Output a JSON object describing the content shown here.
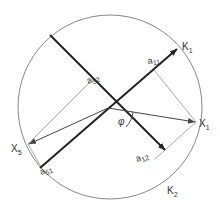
{
  "diagram": {
    "title": "",
    "circle": {
      "cx": 110,
      "cy": 107,
      "r": 92,
      "stroke": "#777777"
    },
    "origin": {
      "x": 108,
      "y": 108
    },
    "axes": [
      {
        "name": "K1",
        "from": [
          40,
          168
        ],
        "to": [
          177,
          49
        ],
        "label": "K",
        "sub": "1",
        "lx": 182,
        "ly": 50
      },
      {
        "name": "K2",
        "from": [
          50,
          35
        ],
        "to": [
          165,
          150
        ],
        "label": "K",
        "sub": "2",
        "lx": 167,
        "ly": 194
      }
    ],
    "points": [
      {
        "name": "X1",
        "x": 196,
        "y": 122,
        "label": "X",
        "sub": "1",
        "lx": 199,
        "ly": 127
      },
      {
        "name": "X5",
        "x": 28,
        "y": 144,
        "label": "X",
        "sub": "5",
        "lx": 11,
        "ly": 152
      }
    ],
    "projections": [
      {
        "from": [
          196,
          122
        ],
        "to": [
          154,
          70
        ]
      },
      {
        "from": [
          196,
          122
        ],
        "to": [
          155,
          159
        ]
      },
      {
        "from": [
          28,
          144
        ],
        "to": [
          90,
          82
        ]
      },
      {
        "from": [
          28,
          144
        ],
        "to": [
          41,
          167
        ]
      }
    ],
    "labels": {
      "a11": {
        "base": "a",
        "sub": "11",
        "x": 148,
        "y": 64
      },
      "a12": {
        "base": "a",
        "sub": "12",
        "x": 137,
        "y": 162
      },
      "a52": {
        "base": "a",
        "sub": "52",
        "x": 88,
        "y": 84
      },
      "a51": {
        "base": "a",
        "sub": "51",
        "x": 41,
        "y": 175
      },
      "phi": {
        "text": "φ",
        "x": 118,
        "y": 125
      }
    },
    "colors": {
      "axis": "#222222",
      "vector": "#555555",
      "projection": "#aaaaaa"
    }
  }
}
